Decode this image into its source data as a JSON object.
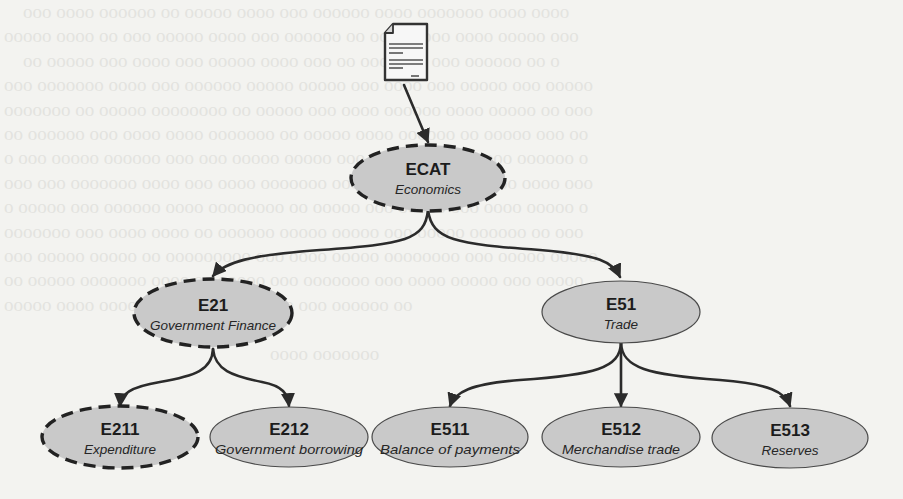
{
  "diagram": {
    "type": "hierarchy-tree",
    "colors": {
      "background": "#f3f3f0",
      "node_fill": "#c9c9c9",
      "stroke": "#2b2b2b",
      "text": "#1c1c1c"
    },
    "legend_semantics": {
      "dashed_outline": "highlighted / selected category path",
      "solid_outline": "regular category"
    },
    "source": {
      "icon": "document-icon",
      "points_to": "ECAT"
    },
    "nodes": {
      "ecat": {
        "code": "ECAT",
        "label": "Economics",
        "outline": "dashed",
        "level": 0
      },
      "e21": {
        "code": "E21",
        "label": "Government Finance",
        "outline": "dashed",
        "level": 1,
        "parent": "ECAT"
      },
      "e51": {
        "code": "E51",
        "label": "Trade",
        "outline": "solid",
        "level": 1,
        "parent": "ECAT"
      },
      "e211": {
        "code": "E211",
        "label": "Expenditure",
        "outline": "dashed",
        "level": 2,
        "parent": "E21"
      },
      "e212": {
        "code": "E212",
        "label": "Government borrowing",
        "outline": "solid",
        "level": 2,
        "parent": "E21"
      },
      "e511": {
        "code": "E511",
        "label": "Balance of payments",
        "outline": "solid",
        "level": 2,
        "parent": "E51"
      },
      "e512": {
        "code": "E512",
        "label": "Merchandise trade",
        "outline": "solid",
        "level": 2,
        "parent": "E51"
      },
      "e513": {
        "code": "E513",
        "label": "Reserves",
        "outline": "solid",
        "level": 2,
        "parent": "E51"
      }
    },
    "edges": [
      {
        "from": "document",
        "to": "ECAT"
      },
      {
        "from": "ECAT",
        "to": "E21"
      },
      {
        "from": "ECAT",
        "to": "E51"
      },
      {
        "from": "E21",
        "to": "E211"
      },
      {
        "from": "E21",
        "to": "E212"
      },
      {
        "from": "E51",
        "to": "E511"
      },
      {
        "from": "E51",
        "to": "E512"
      },
      {
        "from": "E51",
        "to": "E513"
      }
    ]
  }
}
